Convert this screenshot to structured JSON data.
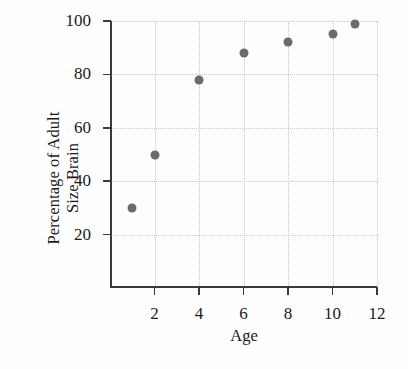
{
  "chart_data": {
    "type": "scatter",
    "title": "",
    "xlabel": "Age",
    "ylabel_lines": [
      "Percentage of Adult",
      "Size Brain"
    ],
    "ylabel": "Percentage of Adult Size Brain",
    "x": [
      1,
      2,
      4,
      6,
      8,
      10,
      11
    ],
    "values": [
      30,
      50,
      78,
      88,
      92,
      95,
      99
    ],
    "points": [
      {
        "x": 1,
        "y": 30
      },
      {
        "x": 2,
        "y": 50
      },
      {
        "x": 4,
        "y": 78
      },
      {
        "x": 6,
        "y": 88
      },
      {
        "x": 8,
        "y": 92
      },
      {
        "x": 10,
        "y": 95
      },
      {
        "x": 11,
        "y": 99
      }
    ],
    "xlim": [
      0,
      12
    ],
    "ylim": [
      0,
      100
    ],
    "xticks": [
      2,
      4,
      6,
      8,
      10,
      12
    ],
    "yticks": [
      20,
      40,
      60,
      80,
      100
    ],
    "xtick_labels": [
      "2",
      "4",
      "6",
      "8",
      "10",
      "12"
    ],
    "ytick_labels": [
      "20",
      "40",
      "60",
      "80",
      "100"
    ],
    "grid": true,
    "grid_style": "dotted",
    "legend": null,
    "marker_color": "#6b6b6b",
    "axis_color": "#3a3a3a",
    "grid_color": "#c9c9c9",
    "background_color": "#fefefe"
  }
}
